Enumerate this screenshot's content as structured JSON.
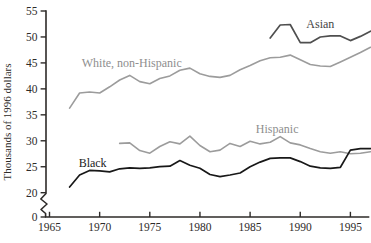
{
  "figure": {
    "background": "#ffffff",
    "text_color": "#2e2b29",
    "axis_color": "#2e2b29"
  },
  "chart_data": {
    "type": "line",
    "title": "",
    "xlabel": "",
    "ylabel": "Thousands of 1996 dollars",
    "grid": false,
    "legend_position": "inline-labels",
    "x_axis": {
      "ticks": [
        1965,
        1970,
        1975,
        1980,
        1985,
        1990,
        1995
      ],
      "tick_labels": [
        "1965",
        "1970",
        "1975",
        "1980",
        "1985",
        "1990",
        "1995"
      ],
      "range": [
        1965,
        1997
      ]
    },
    "y_axis": {
      "ticks": [
        0,
        20,
        25,
        30,
        35,
        40,
        45,
        50,
        55
      ],
      "tick_labels": [
        "0",
        "20",
        "25",
        "30",
        "35",
        "40",
        "45",
        "50",
        "55"
      ],
      "broken_axis": true,
      "break_between": [
        0,
        20
      ],
      "display_range": [
        20,
        55
      ]
    },
    "series": [
      {
        "name": "White, non-Hispanic",
        "color": "#9c9c9c",
        "label_color": "#8e8e8e",
        "width": 1.6,
        "start_year": 1967,
        "label_pos": {
          "year": 1973.2,
          "value": 44.9
        },
        "values": [
          36.3,
          39.2,
          39.4,
          39.2,
          40.4,
          41.7,
          42.6,
          41.4,
          41.0,
          42.0,
          42.5,
          43.6,
          44.0,
          42.9,
          42.4,
          42.2,
          42.6,
          43.7,
          44.5,
          45.4,
          46.0,
          46.1,
          46.5,
          45.6,
          44.7,
          44.4,
          44.3,
          45.2,
          46.1,
          47.0,
          48.0
        ]
      },
      {
        "name": "Hispanic",
        "color": "#9c9c9c",
        "label_color": "#8e8e8e",
        "width": 1.6,
        "start_year": 1972,
        "label_pos": {
          "year": 1987.7,
          "value": 32.2
        },
        "values": [
          29.5,
          29.6,
          28.1,
          27.6,
          28.9,
          29.8,
          29.4,
          30.9,
          29.1,
          27.9,
          28.2,
          29.5,
          28.9,
          29.9,
          29.4,
          29.7,
          30.8,
          29.6,
          29.2,
          28.5,
          27.9,
          27.6,
          27.9,
          27.5,
          27.6,
          27.9
        ]
      },
      {
        "name": "Asian",
        "color": "#4f4f4f",
        "label_color": "#454545",
        "width": 1.7,
        "start_year": 1987,
        "label_pos": {
          "year": 1992.0,
          "value": 52.4
        },
        "values": [
          49.8,
          52.3,
          52.4,
          48.9,
          48.9,
          50.0,
          50.2,
          50.2,
          49.3,
          50.1,
          51.1
        ]
      },
      {
        "name": "Black",
        "color": "#181818",
        "label_color": "#222222",
        "width": 1.7,
        "start_year": 1967,
        "label_pos": {
          "year": 1969.3,
          "value": 25.8
        },
        "values": [
          21.1,
          23.4,
          24.3,
          24.2,
          24.0,
          24.6,
          24.8,
          24.7,
          24.8,
          25.0,
          25.1,
          26.2,
          25.3,
          24.7,
          23.5,
          23.1,
          23.4,
          23.8,
          25.0,
          25.9,
          26.6,
          26.7,
          26.7,
          26.0,
          25.1,
          24.8,
          24.7,
          24.9,
          28.2,
          28.5,
          28.5
        ]
      }
    ]
  }
}
